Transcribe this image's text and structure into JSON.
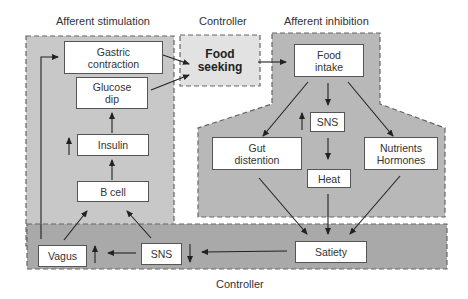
{
  "regions": {
    "afferent_stimulation": {
      "label": "Afferent stimulation"
    },
    "controller_top": {
      "label": "Controller"
    },
    "afferent_inhibition": {
      "label": "Afferent inhibition"
    },
    "controller_bottom": {
      "label": "Controller"
    }
  },
  "nodes": {
    "gastric_contraction": "Gastric\ncontraction",
    "glucose_dip": "Glucose\ndip",
    "insulin": "Insulin",
    "b_cell": "B cell",
    "food_seeking": "Food\nseeking",
    "food_intake": "Food\nintake",
    "sns_top": "SNS",
    "gut_distention": "Gut\ndistention",
    "heat": "Heat",
    "nutrients_hormones": "Nutrients\nHormones",
    "vagus": "Vagus",
    "sns_bottom": "SNS",
    "satiety": "Satiety"
  },
  "indicators": {
    "insulin_up": "↑",
    "sns_top_up": "↑",
    "vagus_up": "↑",
    "sns_bottom_down": "↓"
  },
  "edges": [
    {
      "from": "Gastric contraction",
      "to": "Food seeking"
    },
    {
      "from": "Glucose dip",
      "to": "Food seeking"
    },
    {
      "from": "Insulin",
      "to": "Glucose dip"
    },
    {
      "from": "B cell",
      "to": "Insulin"
    },
    {
      "from": "Vagus",
      "to": "B cell"
    },
    {
      "from": "SNS",
      "to": "B cell"
    },
    {
      "from": "Vagus",
      "to": "Gastric contraction"
    },
    {
      "from": "Food seeking",
      "to": "Food intake"
    },
    {
      "from": "Food intake",
      "to": "SNS"
    },
    {
      "from": "Food intake",
      "to": "Gut distention"
    },
    {
      "from": "Food intake",
      "to": "Nutrients Hormones"
    },
    {
      "from": "SNS",
      "to": "Heat"
    },
    {
      "from": "Gut distention",
      "to": "Satiety"
    },
    {
      "from": "Heat",
      "to": "Satiety"
    },
    {
      "from": "Nutrients Hormones",
      "to": "Satiety"
    },
    {
      "from": "Satiety",
      "to": "SNS"
    },
    {
      "from": "SNS",
      "to": "Vagus"
    }
  ],
  "colors": {
    "stimulation_fill": "#c8c8c8",
    "seeking_fill": "#e2e2e2",
    "inhibition_fill": "#b8b8b8",
    "controller_fill": "#a9a9a9",
    "line": "#222222"
  }
}
